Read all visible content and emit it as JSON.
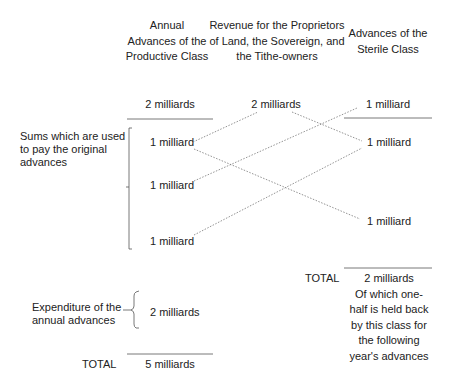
{
  "headers": {
    "productive": [
      "Annual",
      "Advances of the",
      "Productive Class"
    ],
    "revenue": [
      "Revenue for the Proprietors",
      "of Land, the Sovereign, and",
      "the Tithe-owners"
    ],
    "sterile": [
      "Advances of the",
      "Sterile Class"
    ]
  },
  "top_values": {
    "productive": "2 milliards",
    "revenue": "2 milliards",
    "sterile": "1 milliard"
  },
  "left_labels": {
    "sums": [
      "Sums which are used",
      "to  pay the original",
      "advances"
    ],
    "expenditure": [
      "Expenditure of the",
      "annual advances"
    ]
  },
  "productive_items": [
    "1 milliard",
    "1 milliard",
    "1 milliard"
  ],
  "sterile_items": [
    "1 milliard",
    "1 milliard"
  ],
  "productive_expenditure": "2 milliards",
  "sterile_total": {
    "label": "TOTAL",
    "value": "2 milliards",
    "note": [
      "Of which one-",
      "half is held back",
      "by this class for",
      "the following",
      "year's advances"
    ]
  },
  "productive_total": {
    "label": "TOTAL",
    "value": "5 milliards"
  },
  "colors": {
    "text": "#222222",
    "line": "#555555",
    "dotted": "#777777"
  }
}
